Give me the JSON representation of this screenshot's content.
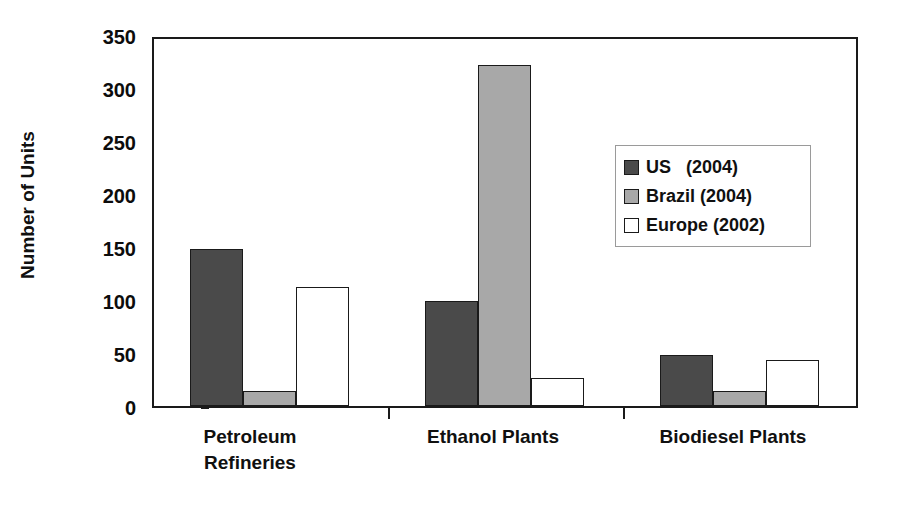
{
  "chart_data": {
    "type": "bar",
    "title": "",
    "xlabel": "",
    "ylabel": "Number of Units",
    "ylim": [
      0,
      350
    ],
    "ytick_step": 50,
    "yticks": [
      "350",
      "300",
      "250",
      "200",
      "150",
      "100",
      "50",
      "0"
    ],
    "grid": false,
    "legend_position": "inside-upper-right",
    "categories": [
      "Petroleum\nRefineries",
      "Ethanol Plants",
      "Biodiesel Plants"
    ],
    "series": [
      {
        "name": "US   (2004)",
        "key": "us",
        "color": "#4a4a4a",
        "values": [
          148,
          99,
          48
        ]
      },
      {
        "name": "Brazil (2004)",
        "key": "brazil",
        "color": "#a8a8a8",
        "values": [
          14,
          322,
          14
        ]
      },
      {
        "name": "Europe (2002)",
        "key": "europe",
        "color": "#ffffff",
        "values": [
          112,
          26,
          43
        ]
      }
    ]
  },
  "axis": {
    "y_title": "Number of Units",
    "y_labels": [
      "350",
      "300",
      "250",
      "200",
      "150",
      "100",
      "50",
      "0"
    ]
  },
  "categories": {
    "petroleum": "Petroleum\nRefineries",
    "ethanol": "Ethanol Plants",
    "biodiesel": "Biodiesel Plants"
  },
  "legend": {
    "items": [
      {
        "label": "US   (2004)"
      },
      {
        "label": "Brazil (2004)"
      },
      {
        "label": "Europe (2002)"
      }
    ]
  },
  "colors": {
    "us": "#4a4a4a",
    "brazil": "#a8a8a8",
    "europe": "#ffffff",
    "axis": "#1a1a1a",
    "background": "#ffffff"
  }
}
